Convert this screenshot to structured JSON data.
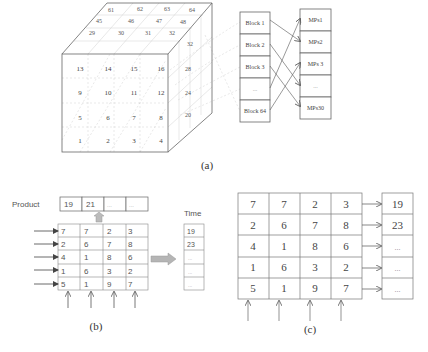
{
  "panel_a": {
    "caption": "(a)",
    "cube": {
      "front_face": [
        [
          "13",
          "14",
          "15",
          "16"
        ],
        [
          "9",
          "10",
          "11",
          "12"
        ],
        [
          "5",
          "6",
          "7",
          "8"
        ],
        [
          "1",
          "2",
          "3",
          "4"
        ]
      ],
      "top_face": [
        [
          "61",
          "62",
          "63",
          "64"
        ],
        [
          "45",
          "46",
          "47",
          "48"
        ],
        [
          "29",
          "30",
          "31",
          "32"
        ]
      ],
      "right_face": [
        "32",
        "28",
        "24",
        "20"
      ]
    },
    "blocks": [
      "Block 1",
      "Block 2",
      "Block 3",
      "...",
      "Block 64"
    ],
    "mps": [
      "MPs1",
      "MPs2",
      "MPs 3",
      "...",
      "MPs30"
    ],
    "mapping": [
      {
        "from": "Block 1",
        "to": "MPs2"
      },
      {
        "from": "Block 2",
        "to": "..."
      },
      {
        "from": "Block 3",
        "to": "MPs30"
      },
      {
        "from": "...",
        "to": "MPs1"
      },
      {
        "from": "Block 64",
        "to": "MPs 3"
      }
    ]
  },
  "panel_b": {
    "caption": "(b)",
    "product_label": "Product",
    "product": [
      "19",
      "21",
      "...",
      "..."
    ],
    "time_label": "Time",
    "time": [
      "19",
      "23",
      "...",
      "...",
      "..."
    ],
    "matrix": [
      [
        "7",
        "7",
        "2",
        "3"
      ],
      [
        "2",
        "6",
        "7",
        "8"
      ],
      [
        "4",
        "1",
        "8",
        "6"
      ],
      [
        "1",
        "6",
        "3",
        "2"
      ],
      [
        "5",
        "1",
        "9",
        "7"
      ]
    ]
  },
  "panel_c": {
    "caption": "(c)",
    "matrix": [
      [
        "7",
        "7",
        "2",
        "3"
      ],
      [
        "2",
        "6",
        "7",
        "8"
      ],
      [
        "4",
        "1",
        "8",
        "6"
      ],
      [
        "1",
        "6",
        "3",
        "2"
      ],
      [
        "5",
        "1",
        "9",
        "7"
      ]
    ],
    "results": [
      "19",
      "23",
      "...",
      "...",
      "..."
    ]
  },
  "colors": {
    "line": "#555555",
    "faint": "#c8c8c8",
    "text": "#333333",
    "gray_arrow": "#a8a8a8"
  }
}
